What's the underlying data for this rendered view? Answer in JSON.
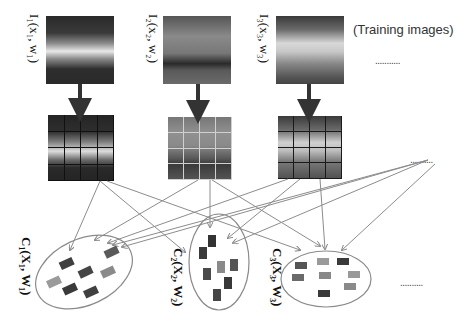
{
  "diagram": {
    "caption": "(Training images)",
    "training_images": [
      {
        "id": "img1",
        "label_prefix": "I",
        "label_sub": "1",
        "label_args": "(x₁, w₁)",
        "label": "I₁(x₁, w₁)"
      },
      {
        "id": "img2",
        "label_prefix": "I",
        "label_sub": "2",
        "label_args": "(x₂, w₂)",
        "label": "I₂(x₂, w₂)"
      },
      {
        "id": "img3",
        "label_prefix": "I",
        "label_sub": "3",
        "label_args": "(x₃, w₃)",
        "label": "I₃(x₃, w₃)"
      }
    ],
    "ellipsis_top": "...........",
    "ellipsis_middle": "..........",
    "ellipsis_bottom": "..........",
    "clusters": [
      {
        "id": "c1",
        "label": "C₁(X₁, W₁)",
        "item_count": 7
      },
      {
        "id": "c2",
        "label": "C₂(X₂, W₂)",
        "item_count": 7
      },
      {
        "id": "c3",
        "label": "C₃(X₃, W₃)",
        "item_count": 8
      }
    ],
    "grid_divisions": "4x4",
    "colors": {
      "arrow_thick": "#333333",
      "arrow_thin": "#9a9a9a",
      "ellipse_stroke": "#8a8a8a",
      "patch_dark": "#3f3f3f",
      "patch_mid": "#6a6a6a",
      "patch_light": "#a0a0a0"
    }
  }
}
